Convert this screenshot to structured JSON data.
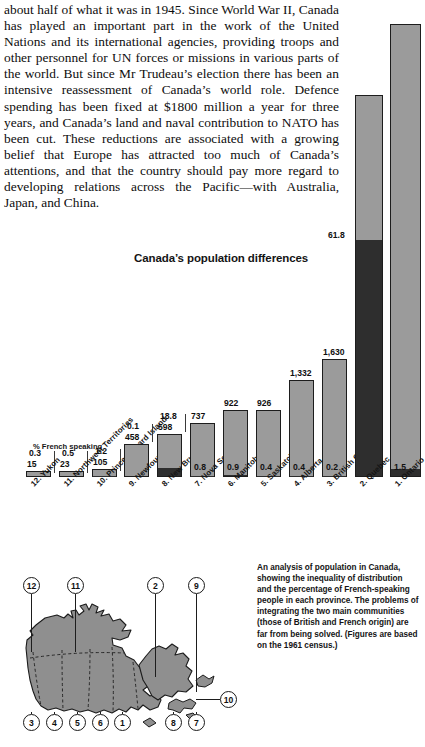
{
  "article": {
    "text": "about half of what it was in 1945. Since World War II, Canada has played an important part in the work of the United Nations and its international agencies, providing troops and other personnel for UN forces or missions in various parts of the world. But since Mr Trudeau’s election there has been an intensive reassessment of Canada’s world role. Defence spending has been fixed at $1800 million a year for three years, and Canada’s land and naval contribution to NATO has been cut. These reductions are associated with a growing belief that Europe has attracted too much of Canada’s attentions, and that the country should pay more regard to developing relations across the Pacific—with Australia, Japan, and China."
  },
  "chart_data": {
    "type": "bar",
    "title": "Canada’s population differences",
    "legend_label": "% French speaking",
    "xlabel": "",
    "ylabel": "",
    "categories": [
      "12. Yukon",
      "11. Northwest Territories",
      "10. Prince Edward Island",
      "9. Newfoundland",
      "8. New Brunswick",
      "7. Nova Scotia",
      "6. Manitoba",
      "5. Saskatchewan",
      "4. Alberta",
      "3. British Columbia",
      "2. Quebec",
      "1. Ontario"
    ],
    "series": [
      {
        "name": "Population (thousands)",
        "unit": "thousands",
        "values": [
          15,
          23,
          105,
          458,
          598,
          737,
          922,
          926,
          1332,
          1630,
          5259,
          6236
        ],
        "labels": [
          "15",
          "23",
          "105",
          "458",
          "598",
          "737",
          "922",
          "926",
          "1,332",
          "1,630",
          "",
          ""
        ]
      },
      {
        "name": "% French speaking",
        "unit": "percent",
        "values": [
          0.3,
          0.5,
          1.2,
          0.1,
          18.8,
          0.8,
          0.9,
          0.4,
          0.4,
          0.2,
          61.8,
          1.5
        ],
        "labels": [
          "0.3",
          "0.5",
          "1.2",
          "0.1",
          "18.8",
          "0.8",
          "0.9",
          "0.4",
          "0.4",
          "0.2",
          "61.8",
          "1.5"
        ]
      }
    ],
    "grid": false,
    "legend_position": "inside-left"
  },
  "caption": {
    "text": "An analysis of population in Canada, showing the inequality of distribution and the percentage of French-speaking people in each province. The problems of integrating the two main communities (those of British and French origin) are far from being solved. (Figures are based on the 1961 census.)"
  },
  "map": {
    "callouts": [
      "12",
      "11",
      "2",
      "9",
      "10",
      "3",
      "4",
      "5",
      "6",
      "1",
      "8",
      "7"
    ]
  },
  "colors": {
    "bar_fill": "#9b9b9b",
    "bar_french": "#2e2e2e",
    "bar_stroke": "#1d1d1d",
    "map_fill": "#8f8f8f",
    "text": "#141414"
  }
}
